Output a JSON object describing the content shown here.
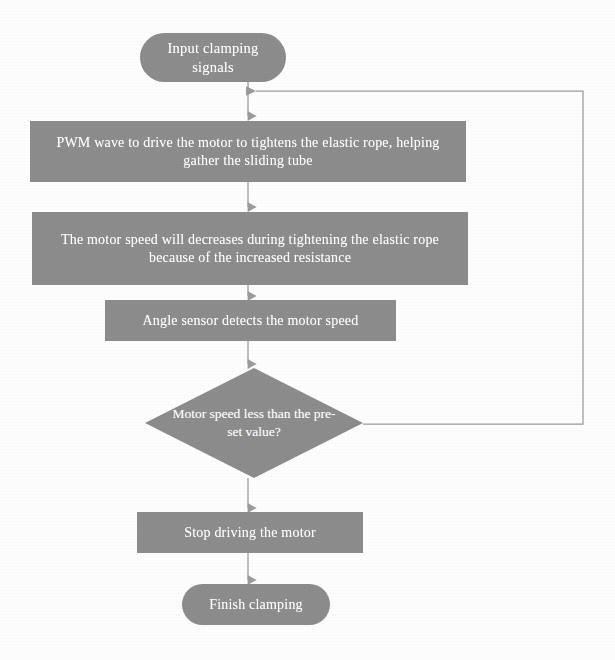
{
  "diagram": {
    "fill_color": "#8c8c8c",
    "text_color": "#ffffff",
    "line_color": "#9a9a9a",
    "background_color": "#fdfdfd",
    "nodes": [
      {
        "id": "start",
        "shape": "terminator",
        "label": "Input clamping signals"
      },
      {
        "id": "pwm",
        "shape": "process",
        "label": "PWM wave to drive the motor to tightens the elastic rope, helping gather the sliding tube"
      },
      {
        "id": "speed",
        "shape": "process",
        "label": "The motor speed will decreases during tightening the elastic rope because of the increased resistance"
      },
      {
        "id": "sensor",
        "shape": "process",
        "label": "Angle sensor detects the motor speed"
      },
      {
        "id": "decision",
        "shape": "decision",
        "label": "Motor speed less than the pre-set value?"
      },
      {
        "id": "stop",
        "shape": "process",
        "label": "Stop driving the motor"
      },
      {
        "id": "finish",
        "shape": "terminator",
        "label": "Finish clamping"
      }
    ],
    "connectors": [
      {
        "id": "start-to-pwm",
        "from": "start",
        "to": "pwm",
        "label": ""
      },
      {
        "id": "pwm-to-speed",
        "from": "pwm",
        "to": "speed",
        "label": ""
      },
      {
        "id": "speed-to-sensor",
        "from": "speed",
        "to": "sensor",
        "label": ""
      },
      {
        "id": "sensor-to-decision",
        "from": "sensor",
        "to": "decision",
        "label": ""
      },
      {
        "id": "decision-to-stop",
        "from": "decision",
        "to": "stop",
        "label": ""
      },
      {
        "id": "stop-to-finish",
        "from": "stop",
        "to": "finish",
        "label": ""
      },
      {
        "id": "feedback-loop",
        "from": "decision",
        "to": "pwm",
        "label": ""
      }
    ]
  }
}
